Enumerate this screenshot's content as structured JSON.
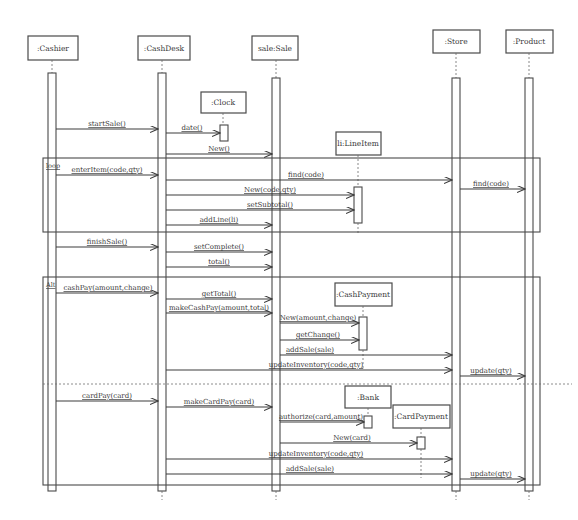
{
  "diagram": {
    "type": "UML sequence diagram",
    "lifelines": [
      {
        "id": "cashier",
        "label": ":Cashier"
      },
      {
        "id": "cashdesk",
        "label": ":CashDesk"
      },
      {
        "id": "sale",
        "label": "sale:Sale"
      },
      {
        "id": "store",
        "label": ":Store"
      },
      {
        "id": "product",
        "label": ":Product"
      },
      {
        "id": "clock",
        "label": ":Clock"
      },
      {
        "id": "lineitem",
        "label": "li:LineItem"
      },
      {
        "id": "cashpayment",
        "label": ":CashPayment"
      },
      {
        "id": "bank",
        "label": ":Bank"
      },
      {
        "id": "cardpayment",
        "label": ":CardPayment"
      }
    ],
    "frames": {
      "loop": {
        "label": "loop"
      },
      "alt": {
        "label": "Alt"
      }
    },
    "messages": [
      {
        "from": "cashier",
        "to": "cashdesk",
        "label": "startSale()"
      },
      {
        "from": "cashdesk",
        "to": "clock",
        "label": "date()"
      },
      {
        "from": "cashdesk",
        "to": "sale",
        "label": "New()"
      },
      {
        "from": "cashier",
        "to": "cashdesk",
        "label": "enterItem(code,qty)"
      },
      {
        "from": "cashdesk",
        "to": "store",
        "label": "find(code)"
      },
      {
        "from": "store",
        "to": "product",
        "label": "find(code)"
      },
      {
        "from": "cashdesk",
        "to": "lineitem",
        "label": "New(code,qty)"
      },
      {
        "from": "cashdesk",
        "to": "lineitem",
        "label": "setSubtotal()"
      },
      {
        "from": "cashdesk",
        "to": "sale",
        "label": "addLine(li)"
      },
      {
        "from": "cashier",
        "to": "cashdesk",
        "label": "finishSale()"
      },
      {
        "from": "cashdesk",
        "to": "sale",
        "label": "setComplete()"
      },
      {
        "from": "cashdesk",
        "to": "sale",
        "label": "total()"
      },
      {
        "from": "cashier",
        "to": "cashdesk",
        "label": "cashPay(amount,change)"
      },
      {
        "from": "cashdesk",
        "to": "sale",
        "label": "getTotal()"
      },
      {
        "from": "cashdesk",
        "to": "sale",
        "label": "makeCashPay(amount,total)"
      },
      {
        "from": "sale",
        "to": "cashpayment",
        "label": "New(amount,change)"
      },
      {
        "from": "sale",
        "to": "cashpayment",
        "label": "getChange()"
      },
      {
        "from": "sale",
        "to": "store",
        "label": "addSale(sale)"
      },
      {
        "from": "cashdesk",
        "to": "store",
        "label": "updateInventory(code,qty)"
      },
      {
        "from": "store",
        "to": "product",
        "label": "update(qty)"
      },
      {
        "from": "cashier",
        "to": "cashdesk",
        "label": "cardPay(card)"
      },
      {
        "from": "cashdesk",
        "to": "sale",
        "label": "makeCardPay(card)"
      },
      {
        "from": "sale",
        "to": "bank",
        "label": "authorize(card,amount)"
      },
      {
        "from": "sale",
        "to": "cardpayment",
        "label": "New(card)"
      },
      {
        "from": "cashdesk",
        "to": "store",
        "label": "updateInventory(code,qty)"
      },
      {
        "from": "sale",
        "to": "store",
        "label": "addSale(sale)"
      },
      {
        "from": "store",
        "to": "product",
        "label": "update(qty)"
      }
    ]
  }
}
